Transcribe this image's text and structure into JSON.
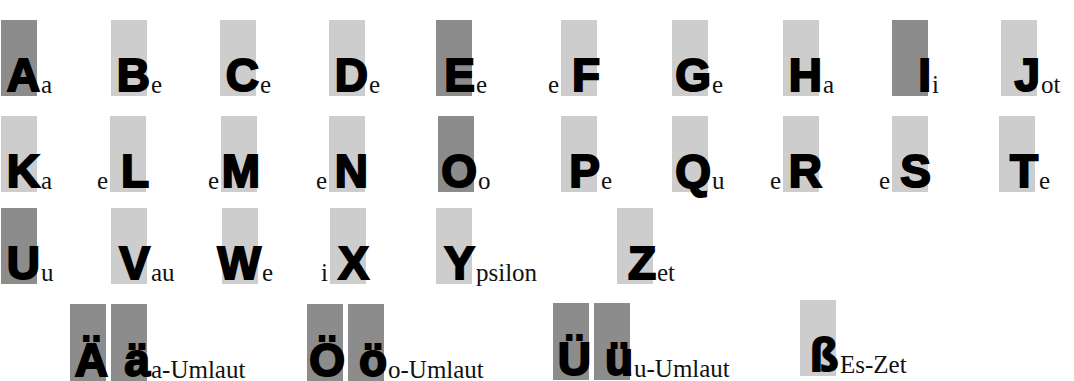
{
  "colors": {
    "vowel_box": "#8c8c8c",
    "consonant_box": "#cdcdcd",
    "letter": "#000000"
  },
  "letters": [
    {
      "big": "A",
      "name": "a",
      "pre": "",
      "x": 1,
      "y": 20,
      "dark": true
    },
    {
      "big": "B",
      "name": "e",
      "pre": "",
      "x": 111,
      "y": 20,
      "dark": false
    },
    {
      "big": "C",
      "name": "e",
      "pre": "",
      "x": 220,
      "y": 20,
      "dark": false
    },
    {
      "big": "D",
      "name": "e",
      "pre": "",
      "x": 329,
      "y": 20,
      "dark": false
    },
    {
      "big": "E",
      "name": "e",
      "pre": "",
      "x": 436,
      "y": 20,
      "dark": true
    },
    {
      "big": "F",
      "name": "",
      "pre": "e",
      "x": 561,
      "y": 20,
      "dark": false
    },
    {
      "big": "G",
      "name": "e",
      "pre": "",
      "x": 672,
      "y": 20,
      "dark": false
    },
    {
      "big": "H",
      "name": "a",
      "pre": "",
      "x": 783,
      "y": 20,
      "dark": false
    },
    {
      "big": "I",
      "name": "i",
      "pre": "",
      "x": 892,
      "y": 20,
      "dark": true
    },
    {
      "big": "J",
      "name": "ot",
      "pre": "",
      "x": 1001,
      "y": 20,
      "dark": false
    },
    {
      "big": "K",
      "name": "a",
      "pre": "",
      "x": 1,
      "y": 116,
      "dark": false
    },
    {
      "big": "L",
      "name": "",
      "pre": "e",
      "x": 110,
      "y": 116,
      "dark": false
    },
    {
      "big": "M",
      "name": "",
      "pre": "e",
      "x": 221,
      "y": 116,
      "dark": false
    },
    {
      "big": "N",
      "name": "",
      "pre": "e",
      "x": 329,
      "y": 116,
      "dark": false
    },
    {
      "big": "O",
      "name": "o",
      "pre": "",
      "x": 438,
      "y": 116,
      "dark": true
    },
    {
      "big": "P",
      "name": "e",
      "pre": "",
      "x": 561,
      "y": 116,
      "dark": false
    },
    {
      "big": "Q",
      "name": "u",
      "pre": "",
      "x": 672,
      "y": 116,
      "dark": false
    },
    {
      "big": "R",
      "name": "",
      "pre": "e",
      "x": 783,
      "y": 116,
      "dark": false
    },
    {
      "big": "S",
      "name": "",
      "pre": "e",
      "x": 892,
      "y": 116,
      "dark": false
    },
    {
      "big": "T",
      "name": "e",
      "pre": "",
      "x": 999,
      "y": 116,
      "dark": false
    },
    {
      "big": "U",
      "name": "u",
      "pre": "",
      "x": 1,
      "y": 208,
      "dark": true
    },
    {
      "big": "V",
      "name": "au",
      "pre": "",
      "x": 111,
      "y": 208,
      "dark": false
    },
    {
      "big": "W",
      "name": "e",
      "pre": "",
      "x": 222,
      "y": 208,
      "dark": false
    },
    {
      "big": "X",
      "name": "",
      "pre": "i",
      "x": 330,
      "y": 208,
      "dark": false
    },
    {
      "big": "Y",
      "name": "psilon",
      "pre": "",
      "x": 436,
      "y": 208,
      "dark": false
    },
    {
      "big": "Z",
      "name": "et",
      "pre": "",
      "x": 617,
      "y": 208,
      "dark": false
    }
  ],
  "specials": [
    {
      "upper": "Ä",
      "lower": "ä",
      "name": "a-Umlaut",
      "x": 70,
      "y": 304
    },
    {
      "upper": "Ö",
      "lower": "ö",
      "name": "o-Umlaut",
      "x": 307,
      "y": 304
    },
    {
      "upper": "Ü",
      "lower": "ü",
      "name": "u-Umlaut",
      "x": 553,
      "y": 303
    }
  ],
  "eszett": {
    "big": "ß",
    "name": "Es-Zet",
    "x": 800,
    "y": 300
  }
}
